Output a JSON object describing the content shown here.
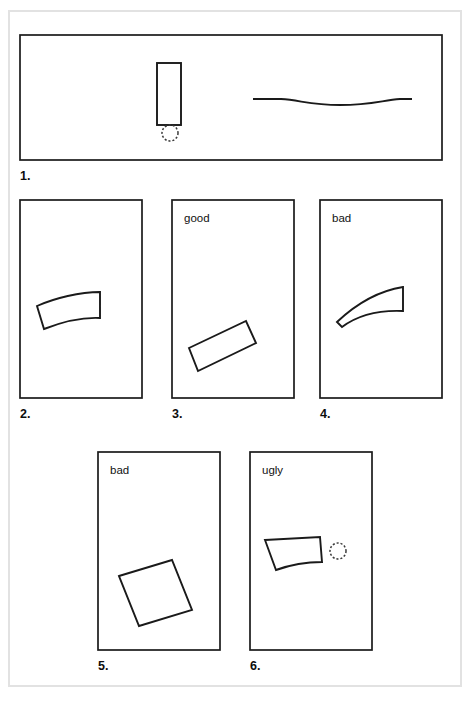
{
  "figure": {
    "title": "",
    "page_border_color": "#e2e2e2",
    "ink_color": "#1a1a1a",
    "background_color": "#ffffff"
  },
  "panels": [
    {
      "number": "1.",
      "label": "",
      "frame": {
        "x": 20,
        "y": 35,
        "w": 422,
        "h": 125
      },
      "number_pos": {
        "x": 20,
        "y": 180
      },
      "contents": [
        "vertical-rectangle",
        "dashed-circle",
        "shallow-curve-line"
      ]
    },
    {
      "number": "2.",
      "label": "",
      "frame": {
        "x": 20,
        "y": 200,
        "w": 122,
        "h": 198
      },
      "number_pos": {
        "x": 20,
        "y": 418
      },
      "label_pos": {
        "x": 32,
        "y": 222
      },
      "contents": [
        "curved-bar"
      ]
    },
    {
      "number": "3.",
      "label": "good",
      "frame": {
        "x": 172,
        "y": 200,
        "w": 122,
        "h": 198
      },
      "number_pos": {
        "x": 172,
        "y": 418
      },
      "label_pos": {
        "x": 184,
        "y": 222
      },
      "contents": [
        "straight-rectangle-tilted-up"
      ]
    },
    {
      "number": "4.",
      "label": "bad",
      "frame": {
        "x": 320,
        "y": 200,
        "w": 122,
        "h": 198
      },
      "number_pos": {
        "x": 320,
        "y": 418
      },
      "label_pos": {
        "x": 332,
        "y": 222
      },
      "contents": [
        "sharply-curved-crescent"
      ]
    },
    {
      "number": "5.",
      "label": "bad",
      "frame": {
        "x": 98,
        "y": 452,
        "w": 122,
        "h": 198
      },
      "number_pos": {
        "x": 98,
        "y": 670
      },
      "label_pos": {
        "x": 110,
        "y": 474
      },
      "contents": [
        "straight-rectangle-tilted-down"
      ]
    },
    {
      "number": "6.",
      "label": "ugly",
      "frame": {
        "x": 250,
        "y": 452,
        "w": 122,
        "h": 198
      },
      "number_pos": {
        "x": 250,
        "y": 670
      },
      "label_pos": {
        "x": 262,
        "y": 474
      },
      "contents": [
        "tapered-wedge",
        "dashed-circle"
      ]
    }
  ],
  "shapes": {
    "panel1_rectangle": {
      "x": 157,
      "y": 63,
      "w": 24,
      "h": 62
    },
    "panel1_dashed_circle": {
      "cx": 170,
      "cy": 133,
      "r": 8
    },
    "panel1_curve_path": "M 253 99 L 281 99 C 300 100 310 105 340 105 C 372 105 383 100 400 99 L 412 99",
    "panel2_bar_path": "M 37 306 C 55 298 80 292 100 292 L 100 318 C 80 317 62 322 44 329 Z",
    "panel3_rectangle_path": "M 189 348 L 246 321 L 256 343 L 198 371 Z",
    "panel4_crescent_path": "M 337 322 C 355 305 378 291 403 287 L 403 311 C 380 310 358 315 342 327 Z",
    "panel5_rectangle_path": "M 119 576 L 172 560 L 192 610 L 139 626 Z",
    "panel6_wedge_path": "M 265 540 L 320 537 L 322 562 C 305 562 287 566 276 570 Z",
    "panel6_dashed_circle": {
      "cx": 338,
      "cy": 551,
      "r": 8
    }
  },
  "page_frame": {
    "x": 9,
    "y": 11,
    "w": 452,
    "h": 675
  }
}
